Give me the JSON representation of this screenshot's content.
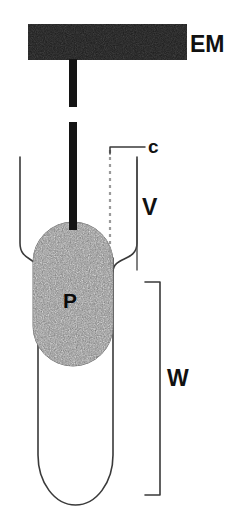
{
  "figure": {
    "background_color": "#ffffff",
    "width": 239,
    "height": 524
  },
  "labels": {
    "electromagnet": "EM",
    "capillary": "c",
    "vessel": "V",
    "outer_wall": "W",
    "plug": "P"
  },
  "colors": {
    "ink": "#111111",
    "bar_fill": "#1a1a1a",
    "rod_fill": "#141414",
    "plug_fill": "#8d8d8d",
    "plug_edge": "#6f6f6f",
    "tube_stroke": "#3a3a3a",
    "dash_stroke": "#9a9a9a"
  },
  "parts": {
    "electromagnet_bar": {
      "name": "EM",
      "x": 28,
      "y": 24,
      "width": 159,
      "height": 36
    },
    "rod_upper": {
      "x": 69,
      "y": 60,
      "width": 8,
      "height": 47
    },
    "rod_lower": {
      "x": 69,
      "y": 122,
      "width": 8,
      "height": 108
    },
    "dashed_capillary": {
      "x": 110,
      "y_top": 150,
      "y_bottom": 268
    },
    "leader_c": {
      "x_start": 110,
      "x_end": 145,
      "y": 147
    },
    "inner_vessel": {
      "name": "V",
      "left_wall_x": 20,
      "right_wall_x": 137,
      "top_y": 155,
      "flare_y": 258
    },
    "plug": {
      "name": "P",
      "cx": 73,
      "cy": 294,
      "rx": 40,
      "ry": 72
    },
    "outer_vessel": {
      "name": "W",
      "left_wall_x": 38,
      "right_wall_x": 113,
      "top_y": 258,
      "bottom_y": 505
    },
    "w_bracket": {
      "x": 160,
      "y_top": 282,
      "y_bottom": 495,
      "tick_length": 15
    }
  },
  "label_positions": {
    "em": {
      "x": 190,
      "y": 52
    },
    "c": {
      "x": 148,
      "y": 151
    },
    "v": {
      "x": 142,
      "y": 214
    },
    "w": {
      "x": 167,
      "y": 385
    },
    "p": {
      "x": 63,
      "y": 308
    }
  }
}
